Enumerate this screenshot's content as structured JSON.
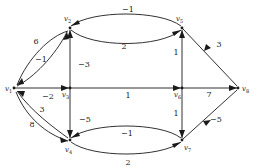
{
  "figure": {
    "type": "directed-weighted-graph",
    "background_color": "#ffffff",
    "stroke_color": "#1a1a1a"
  },
  "vertices": [
    {
      "id": "v1",
      "name": "v",
      "sub": "1",
      "x": 14,
      "y": 88,
      "label_x": 5,
      "label_y": 91
    },
    {
      "id": "v2",
      "name": "v",
      "sub": "2",
      "x": 70,
      "y": 28,
      "label_x": 64,
      "label_y": 21
    },
    {
      "id": "v3",
      "name": "v",
      "sub": "3",
      "x": 70,
      "y": 88,
      "label_x": 62,
      "label_y": 97
    },
    {
      "id": "v4",
      "name": "v",
      "sub": "4",
      "x": 70,
      "y": 140,
      "label_x": 65,
      "label_y": 152
    },
    {
      "id": "v5",
      "name": "v",
      "sub": "5",
      "x": 182,
      "y": 28,
      "label_x": 176,
      "label_y": 21
    },
    {
      "id": "v6",
      "name": "v",
      "sub": "6",
      "x": 182,
      "y": 88,
      "label_x": 174,
      "label_y": 97
    },
    {
      "id": "v7",
      "name": "v",
      "sub": "7",
      "x": 182,
      "y": 140,
      "label_x": 184,
      "label_y": 150
    },
    {
      "id": "v8",
      "name": "v",
      "sub": "8",
      "x": 238,
      "y": 88,
      "label_x": 242,
      "label_y": 91
    }
  ],
  "edges": [
    {
      "id": "e-v2-v1",
      "from": "v2",
      "to": "v1",
      "weight": "6",
      "shape": "curve",
      "label_x": 36,
      "label_y": 44
    },
    {
      "id": "e-v1-v2",
      "from": "v1",
      "to": "v2",
      "weight": "−1",
      "shape": "curve",
      "label_x": 41,
      "label_y": 62
    },
    {
      "id": "e-v1-v3",
      "from": "v1",
      "to": "v3",
      "weight": "−2",
      "shape": "line",
      "label_x": 48,
      "label_y": 99
    },
    {
      "id": "e-v4-v1",
      "from": "v4",
      "to": "v1",
      "weight": "3",
      "shape": "curve",
      "label_x": 42,
      "label_y": 112
    },
    {
      "id": "e-v1-v4",
      "from": "v1",
      "to": "v4",
      "weight": "8",
      "shape": "curve",
      "label_x": 32,
      "label_y": 127
    },
    {
      "id": "e-v5-v2",
      "from": "v5",
      "to": "v2",
      "weight": "−1",
      "shape": "curve",
      "label_x": 128,
      "label_y": 12
    },
    {
      "id": "e-v2-v5",
      "from": "v2",
      "to": "v5",
      "weight": "2",
      "shape": "curve",
      "label_x": 124,
      "label_y": 49
    },
    {
      "id": "e-v3-v2",
      "from": "v3",
      "to": "v2",
      "weight": "−3",
      "shape": "line",
      "label_x": 84,
      "label_y": 67
    },
    {
      "id": "e-v3-v4",
      "from": "v3",
      "to": "v4",
      "weight": "−5",
      "shape": "line",
      "label_x": 85,
      "label_y": 122
    },
    {
      "id": "e-v3-v6",
      "from": "v3",
      "to": "v6",
      "weight": "1",
      "shape": "line",
      "label_x": 128,
      "label_y": 98
    },
    {
      "id": "e-v6-v5",
      "from": "v6",
      "to": "v5",
      "weight": "1",
      "shape": "line",
      "label_x": 176,
      "label_y": 55
    },
    {
      "id": "e-v6-v7",
      "from": "v6",
      "to": "v7",
      "weight": "1",
      "shape": "line",
      "label_x": 176,
      "label_y": 116
    },
    {
      "id": "e-v8-v5",
      "from": "v8",
      "to": "v5",
      "weight": "3",
      "shape": "line",
      "label_x": 219,
      "label_y": 47
    },
    {
      "id": "e-v6-v8",
      "from": "v6",
      "to": "v8",
      "weight": "7",
      "shape": "line",
      "label_x": 209,
      "label_y": 97
    },
    {
      "id": "e-v8-v7",
      "from": "v8",
      "to": "v7",
      "weight": "−5",
      "shape": "line",
      "label_x": 216,
      "label_y": 122
    },
    {
      "id": "e-v7-v4",
      "from": "v7",
      "to": "v4",
      "weight": "−1",
      "shape": "curve",
      "label_x": 127,
      "label_y": 136
    },
    {
      "id": "e-v4-v7",
      "from": "v4",
      "to": "v7",
      "weight": "2",
      "shape": "curve",
      "label_x": 128,
      "label_y": 165
    }
  ]
}
